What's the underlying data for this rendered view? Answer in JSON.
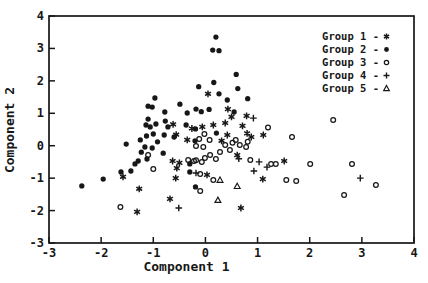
{
  "figure": {
    "background_color": "#ffffff",
    "ink_color": "#171717",
    "title": ""
  },
  "chart_data": {
    "type": "scatter",
    "title": "",
    "xlabel": "Component 1",
    "ylabel": "Component 2",
    "xlim": [
      -3,
      4
    ],
    "ylim": [
      -3,
      4
    ],
    "xticks": [
      "-3",
      "-2",
      "-1",
      "0",
      "1",
      "2",
      "3",
      "4"
    ],
    "yticks": [
      "-3",
      "-2",
      "-1",
      "0",
      "1",
      "2",
      "3",
      "4"
    ],
    "grid": false,
    "legend_position": "top-right-inside",
    "legend_separator": "-",
    "series": [
      {
        "name": "Group 1",
        "marker": "asterisk",
        "points": [
          [
            0.05,
            1.6
          ],
          [
            0.43,
            1.13
          ],
          [
            0.5,
            0.89
          ],
          [
            0.79,
            0.92
          ],
          [
            0.15,
            0.64
          ],
          [
            0.38,
            0.7
          ],
          [
            -0.06,
            0.58
          ],
          [
            0.71,
            0.61
          ],
          [
            -0.26,
            0.53
          ],
          [
            -0.62,
            0.66
          ],
          [
            0.42,
            0.33
          ],
          [
            0.8,
            0.38
          ],
          [
            0.88,
            0.27
          ],
          [
            1.11,
            0.33
          ],
          [
            0.31,
            0.15
          ],
          [
            -0.35,
            0.18
          ],
          [
            -0.56,
            0.34
          ],
          [
            0.61,
            -0.29
          ],
          [
            -0.63,
            -0.47
          ],
          [
            -0.5,
            -0.53
          ],
          [
            -0.55,
            -0.69
          ],
          [
            0.03,
            -0.9
          ],
          [
            -0.57,
            -1.0
          ],
          [
            -0.68,
            -1.64
          ],
          [
            -1.31,
            -2.04
          ],
          [
            -1.58,
            -0.96
          ],
          [
            -1.27,
            -1.33
          ],
          [
            1.51,
            -0.47
          ],
          [
            1.1,
            -1.03
          ],
          [
            0.68,
            -1.92
          ]
        ]
      },
      {
        "name": "Group 2",
        "marker": "filled-circle",
        "points": [
          [
            0.2,
            3.35
          ],
          [
            0.14,
            2.95
          ],
          [
            0.26,
            2.93
          ],
          [
            0.16,
            1.95
          ],
          [
            -0.13,
            1.82
          ],
          [
            0.59,
            2.2
          ],
          [
            0.62,
            1.76
          ],
          [
            0.81,
            1.45
          ],
          [
            0.26,
            1.6
          ],
          [
            0.42,
            1.41
          ],
          [
            -0.97,
            1.47
          ],
          [
            -0.49,
            1.28
          ],
          [
            -1.1,
            1.22
          ],
          [
            -1.02,
            1.19
          ],
          [
            -0.78,
            1.04
          ],
          [
            -0.35,
            1.01
          ],
          [
            -0.18,
            1.13
          ],
          [
            -0.08,
            1.05
          ],
          [
            0.07,
            1.12
          ],
          [
            0.55,
            1.04
          ],
          [
            -1.1,
            0.82
          ],
          [
            -1.14,
            0.64
          ],
          [
            -1.06,
            0.58
          ],
          [
            -0.95,
            0.67
          ],
          [
            -0.77,
            0.76
          ],
          [
            -0.72,
            0.58
          ],
          [
            -1.0,
            0.36
          ],
          [
            -1.13,
            0.3
          ],
          [
            -0.79,
            0.33
          ],
          [
            -0.37,
            0.64
          ],
          [
            -0.19,
            0.52
          ],
          [
            0.21,
            0.39
          ],
          [
            -0.6,
            0.27
          ],
          [
            -0.92,
            0.12
          ],
          [
            -1.02,
            -0.07
          ],
          [
            -1.16,
            -0.04
          ],
          [
            -0.81,
            -0.23
          ],
          [
            -0.2,
            0.15
          ],
          [
            -1.52,
            0.05
          ],
          [
            -1.25,
            0.18
          ],
          [
            -1.23,
            -0.2
          ],
          [
            -1.29,
            -0.47
          ],
          [
            -1.35,
            -0.56
          ],
          [
            -1.62,
            -0.81
          ],
          [
            -1.43,
            -0.78
          ],
          [
            -1.96,
            -1.03
          ],
          [
            -2.37,
            -1.24
          ],
          [
            -1.12,
            -0.41
          ],
          [
            -0.3,
            -0.81
          ],
          [
            -0.19,
            -1.27
          ],
          [
            -0.3,
            -0.56
          ]
        ]
      },
      {
        "name": "Group 3",
        "marker": "open-circle",
        "points": [
          [
            0.58,
            0.18
          ],
          [
            0.52,
            0.09
          ],
          [
            0.38,
            0.02
          ],
          [
            0.47,
            -0.13
          ],
          [
            0.28,
            -0.19
          ],
          [
            0.09,
            -0.29
          ],
          [
            -0.01,
            -0.38
          ],
          [
            -0.18,
            -0.45
          ],
          [
            -0.07,
            -0.5
          ],
          [
            -1.1,
            -0.29
          ],
          [
            1.2,
            0.56
          ],
          [
            1.66,
            0.27
          ],
          [
            0.66,
            0.02
          ],
          [
            0.78,
            -0.04
          ],
          [
            0.86,
            -0.44
          ],
          [
            1.26,
            -0.56
          ],
          [
            1.35,
            -0.56
          ],
          [
            2.01,
            -0.56
          ],
          [
            1.55,
            -1.06
          ],
          [
            1.74,
            -1.09
          ],
          [
            2.45,
            0.79
          ],
          [
            2.81,
            -0.56
          ],
          [
            3.27,
            -1.21
          ],
          [
            2.66,
            -1.52
          ],
          [
            -1.63,
            -1.89
          ],
          [
            -1.0,
            -0.72
          ],
          [
            -0.33,
            -0.44
          ],
          [
            -0.22,
            -0.47
          ],
          [
            0.2,
            -0.41
          ],
          [
            -0.1,
            -0.87
          ],
          [
            0.15,
            -1.06
          ],
          [
            -0.1,
            -1.4
          ],
          [
            -0.02,
            0.36
          ],
          [
            -0.12,
            0.21
          ],
          [
            0.08,
            0.18
          ],
          [
            0.81,
            0.12
          ],
          [
            -0.18,
            -0.01
          ],
          [
            -0.04,
            -0.04
          ]
        ]
      },
      {
        "name": "Group 4",
        "marker": "plus",
        "points": [
          [
            0.92,
            0.85
          ],
          [
            0.64,
            -0.4
          ],
          [
            1.03,
            -0.5
          ],
          [
            1.18,
            -0.66
          ],
          [
            0.93,
            -0.78
          ],
          [
            -0.18,
            -0.84
          ],
          [
            -0.51,
            -1.92
          ],
          [
            2.97,
            -1.0
          ]
        ]
      },
      {
        "name": "Group 5",
        "marker": "open-triangle",
        "points": [
          [
            0.28,
            -1.06
          ],
          [
            0.61,
            -1.25
          ],
          [
            0.24,
            -1.68
          ]
        ]
      }
    ]
  }
}
